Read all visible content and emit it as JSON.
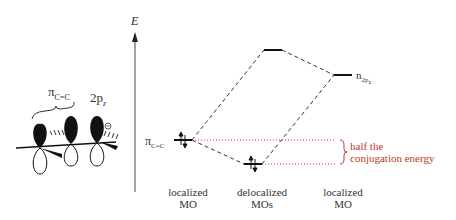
{
  "axis": {
    "label": "E"
  },
  "orbitals_left": {
    "pi_label": "π",
    "pi_sub": "C=C",
    "p_label": "2p",
    "p_sub": "z",
    "charge": "⊖"
  },
  "levels": {
    "pi_cc": {
      "label": "π",
      "sub": "C=C"
    },
    "n": {
      "label": "n",
      "sub": "2p",
      "subsub": "z"
    }
  },
  "annotation": {
    "line1": "half the",
    "line2": "conjugation energy",
    "color": "#c0392b"
  },
  "columns": [
    {
      "line1": "localized",
      "line2": "MO"
    },
    {
      "line1": "delocalized",
      "line2": "MOs"
    },
    {
      "line1": "localized",
      "line2": "MO"
    }
  ]
}
